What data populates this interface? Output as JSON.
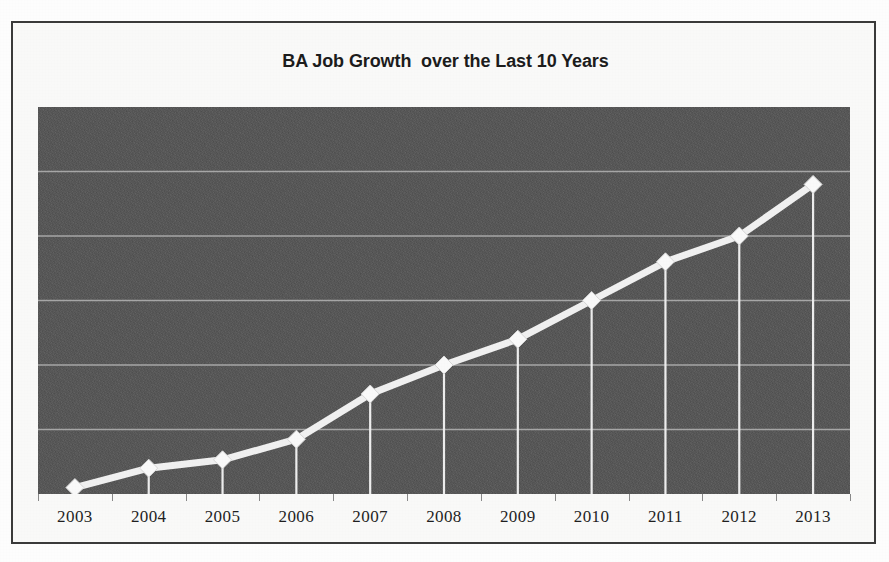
{
  "document": {
    "background_color": "#ffffff",
    "frame_border_color": "#3a3a3a",
    "paper_color": "#fbfbfa"
  },
  "chart": {
    "title": "BA Job Growth  over the Last 10 Years",
    "plot_background_color": "#565656",
    "series_color": "#f2f2f2",
    "gridline_color": "#a8a8a8",
    "marker_shape": "diamond",
    "x_axis": {
      "labels": [
        "2003",
        "2004",
        "2005",
        "2006",
        "2007",
        "2008",
        "2009",
        "2010",
        "2011",
        "2012",
        "2013"
      ]
    }
  },
  "chart_data": {
    "type": "line",
    "title": "BA Job Growth  over the Last 10 Years",
    "xlabel": "",
    "ylabel": "",
    "categories": [
      "2003",
      "2004",
      "2005",
      "2006",
      "2007",
      "2008",
      "2009",
      "2010",
      "2011",
      "2012",
      "2013"
    ],
    "values": [
      0.1,
      0.4,
      0.53,
      0.85,
      1.55,
      2.0,
      2.4,
      3.0,
      3.6,
      4.0,
      4.8
    ],
    "ylim": [
      0,
      6
    ],
    "y_tick_values": [
      0,
      1,
      2,
      3,
      4,
      5,
      6
    ],
    "y_tick_labels_shown": false,
    "gridlines": {
      "horizontal": true,
      "vertical": false,
      "count": 5
    },
    "drop_lines": true,
    "markers": "diamond",
    "legend": null,
    "legend_position": "none",
    "series": [
      {
        "name": "BA Job Growth",
        "values": [
          0.1,
          0.4,
          0.53,
          0.85,
          1.55,
          2.0,
          2.4,
          3.0,
          3.6,
          4.0,
          4.8
        ]
      }
    ]
  }
}
